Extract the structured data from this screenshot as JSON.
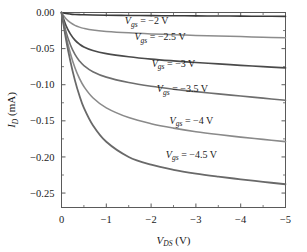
{
  "chart_data": {
    "type": "line",
    "title": "",
    "xlabel": "V_DS (V)",
    "ylabel": "I_D (mA)",
    "xlabel_parts": {
      "main": "V",
      "sub": "DS",
      "unit": "(V)"
    },
    "ylabel_parts": {
      "main": "I",
      "sub": "D",
      "unit": "(mA)"
    },
    "xlim": [
      0,
      -5
    ],
    "ylim": [
      0.0,
      -0.27
    ],
    "grid": false,
    "legend_position": "inline-annotations",
    "xticks": [
      "0",
      "−1",
      "−2",
      "−3",
      "−4",
      "−5"
    ],
    "xtick_values": [
      0,
      -1,
      -2,
      -3,
      -4,
      -5
    ],
    "yticks": [
      "0.00",
      "−0.05",
      "−0.10",
      "−0.15",
      "−0.20",
      "−0.25"
    ],
    "ytick_values": [
      0.0,
      -0.05,
      -0.1,
      -0.15,
      -0.2,
      -0.25
    ],
    "x": [
      0,
      -0.1,
      -0.2,
      -0.3,
      -0.4,
      -0.5,
      -0.7,
      -1.0,
      -1.5,
      -2.0,
      -2.5,
      -3.0,
      -3.5,
      -4.0,
      -4.5,
      -5.0
    ],
    "series": [
      {
        "name": "Vgs = −2 V",
        "label_main": "V",
        "label_sub": "gs",
        "label_rest": " = −2 V",
        "color": "#3a3a3a",
        "width": 1.6,
        "values": [
          0.0,
          -0.0014,
          -0.0022,
          -0.0027,
          -0.003,
          -0.0032,
          -0.0035,
          -0.0038,
          -0.0041,
          -0.0043,
          -0.0045,
          -0.0047,
          -0.0049,
          -0.005,
          -0.0052,
          -0.0054
        ]
      },
      {
        "name": "Vgs = −2.5 V",
        "label_main": "V",
        "label_sub": "gs",
        "label_rest": " = −2.5 V",
        "color": "#8c8c8c",
        "width": 1.5,
        "values": [
          0.0,
          -0.0085,
          -0.014,
          -0.0178,
          -0.0203,
          -0.022,
          -0.0243,
          -0.0262,
          -0.0282,
          -0.0296,
          -0.0307,
          -0.0317,
          -0.0326,
          -0.0334,
          -0.0342,
          -0.035
        ]
      },
      {
        "name": "Vgs = −3 V",
        "label_main": "V",
        "label_sub": "gs",
        "label_rest": " = −3 V",
        "color": "#4a4a4a",
        "width": 1.7,
        "values": [
          0.0,
          -0.018,
          -0.03,
          -0.0382,
          -0.0437,
          -0.0477,
          -0.0527,
          -0.057,
          -0.0613,
          -0.0645,
          -0.067,
          -0.0692,
          -0.0712,
          -0.0731,
          -0.075,
          -0.0768
        ]
      },
      {
        "name": "Vgs = −3.5 V",
        "label_main": "V",
        "label_sub": "gs",
        "label_rest": " = −3.5 V",
        "color": "#6e6e6e",
        "width": 1.6,
        "values": [
          0.0,
          -0.0265,
          -0.045,
          -0.058,
          -0.067,
          -0.0735,
          -0.082,
          -0.0895,
          -0.097,
          -0.1022,
          -0.1062,
          -0.1096,
          -0.1127,
          -0.1157,
          -0.1186,
          -0.1215
        ]
      },
      {
        "name": "Vgs = −4 V",
        "label_main": "V",
        "label_sub": "gs",
        "label_rest": " = −4 V",
        "color": "#8a8a8a",
        "width": 1.6,
        "values": [
          0.0,
          -0.032,
          -0.057,
          -0.0765,
          -0.0912,
          -0.1025,
          -0.118,
          -0.132,
          -0.1455,
          -0.154,
          -0.1601,
          -0.165,
          -0.169,
          -0.1725,
          -0.1757,
          -0.1788
        ]
      },
      {
        "name": "Vgs = −4.5 V",
        "label_main": "V",
        "label_sub": "gs",
        "label_rest": " = −4.5 V",
        "color": "#696969",
        "width": 1.8,
        "values": [
          0.0,
          -0.037,
          -0.068,
          -0.094,
          -0.115,
          -0.132,
          -0.156,
          -0.179,
          -0.2,
          -0.2108,
          -0.2178,
          -0.223,
          -0.2272,
          -0.231,
          -0.2345,
          -0.2378
        ]
      }
    ],
    "annotations": [
      {
        "text": "Vgs = −2 V",
        "x": -1.9,
        "y": -0.0115
      },
      {
        "text": "Vgs = −2.5 V",
        "x": -2.2,
        "y": -0.0335
      },
      {
        "text": "Vgs = −3 V",
        "x": -2.5,
        "y": -0.07
      },
      {
        "text": "Vgs = −3.5 V",
        "x": -2.7,
        "y": -0.1055
      },
      {
        "text": "Vgs = −4 V",
        "x": -2.9,
        "y": -0.149
      },
      {
        "text": "Vgs = −4.5 V",
        "x": -2.9,
        "y": -0.196
      }
    ]
  },
  "colors": {
    "axis": "#5a5a5a",
    "text": "#1a1a1a",
    "background": "#ffffff"
  }
}
